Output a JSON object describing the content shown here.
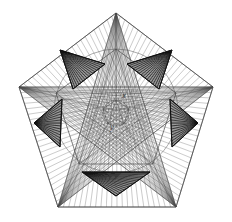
{
  "figure": {
    "background_color": "#ffffff",
    "line_color": "#4a4a4a",
    "fan_line_color": "#5a5a5a",
    "shade_fill": "#9a9a9a",
    "shade_stroke": "#111111",
    "hatch_color": "#1a1a1a",
    "label_color": "#2b2b2b",
    "width": 232,
    "height": 222
  },
  "labels": [
    {
      "id": "x",
      "text": "x",
      "x": 124,
      "y": 98
    },
    {
      "id": "y",
      "text": "y",
      "x": 112,
      "y": 130
    }
  ],
  "geometry": {
    "outer_pentagon": {
      "name": "outer-pentagon",
      "center": [
        116,
        111
      ],
      "vertices": [
        [
          116,
          13
        ],
        [
          213,
          87
        ],
        [
          176,
          207
        ],
        [
          58,
          207
        ],
        [
          19,
          87
        ]
      ]
    },
    "inner_pentagon": {
      "name": "inner-pentagon",
      "center": [
        116,
        111
      ],
      "vertices": [
        [
          116,
          49
        ],
        [
          176,
          93
        ],
        [
          153,
          164
        ],
        [
          79,
          164
        ],
        [
          56,
          93
        ]
      ]
    },
    "core_pentagon": {
      "name": "core-pentagon",
      "center": [
        116,
        113
      ],
      "vertices": [
        [
          116,
          100
        ],
        [
          129,
          109
        ],
        [
          124,
          124
        ],
        [
          108,
          124
        ],
        [
          103,
          109
        ]
      ]
    },
    "central_circle": {
      "name": "central-circle",
      "cx": 116,
      "cy": 113,
      "r": 13
    },
    "mid_circle": {
      "name": "mid-circle",
      "cx": 116,
      "cy": 111,
      "r": 62
    },
    "shaded_triangles": [
      {
        "id": "triangle-top-left",
        "points": [
          [
            60,
            50
          ],
          [
            105,
            64
          ],
          [
            73,
            89
          ]
        ]
      },
      {
        "id": "triangle-top-right",
        "points": [
          [
            172,
            50
          ],
          [
            127,
            64
          ],
          [
            159,
            89
          ]
        ]
      },
      {
        "id": "triangle-left",
        "points": [
          [
            34,
            123
          ],
          [
            62,
            99
          ],
          [
            60,
            147
          ]
        ]
      },
      {
        "id": "triangle-right",
        "points": [
          [
            198,
            123
          ],
          [
            170,
            99
          ],
          [
            172,
            147
          ]
        ]
      },
      {
        "id": "triangle-bottom",
        "points": [
          [
            82,
            172
          ],
          [
            150,
            172
          ],
          [
            116,
            196
          ]
        ]
      }
    ],
    "fan_line_count_per_vertex": 22
  }
}
